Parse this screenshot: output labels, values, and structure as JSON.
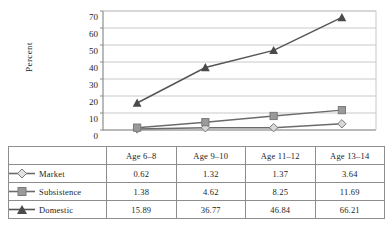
{
  "chart_data": {
    "type": "line",
    "title": "",
    "xlabel": "",
    "ylabel": "Percent",
    "ylim": [
      0,
      70
    ],
    "ytick_step": 10,
    "yticks": [
      70,
      60,
      50,
      40,
      30,
      20,
      10,
      0
    ],
    "grid": "horizontal",
    "legend_position": "table-left",
    "categories": [
      "Age 6–8",
      "Age 9–10",
      "Age 11–12",
      "Age 13–14"
    ],
    "series": [
      {
        "name": "Market",
        "marker": "diamond",
        "color": "#d8d8d8",
        "line_color": "#6b6b6b",
        "values": [
          0.62,
          1.32,
          1.37,
          3.64
        ]
      },
      {
        "name": "Subsistence",
        "marker": "square",
        "color": "#9a9a9a",
        "line_color": "#6b6b6b",
        "values": [
          1.38,
          4.62,
          8.25,
          11.69
        ]
      },
      {
        "name": "Domestic",
        "marker": "triangle",
        "color": "#4a4a4a",
        "line_color": "#555555",
        "values": [
          15.89,
          36.77,
          46.84,
          66.21
        ]
      }
    ]
  },
  "table": {
    "corner_label": "",
    "headers": [
      "Age 6–8",
      "Age 9–10",
      "Age 11–12",
      "Age 13–14"
    ],
    "rows": [
      {
        "label": "Market",
        "values": [
          "0.62",
          "1.32",
          "1.37",
          "3.64"
        ]
      },
      {
        "label": "Subsistence",
        "values": [
          "1.38",
          "4.62",
          "8.25",
          "11.69"
        ]
      },
      {
        "label": "Domestic",
        "values": [
          "15.89",
          "36.77",
          "46.84",
          "66.21"
        ]
      }
    ]
  },
  "axis": {
    "y_title": "Percent",
    "y_tick_labels": [
      "70",
      "60",
      "50",
      "40",
      "30",
      "20",
      "10",
      "0"
    ]
  },
  "colors": {
    "axis_line": "#8d8d8d",
    "grid_line": "#c9c9c9",
    "table_border": "#8d8d8d",
    "text": "#1c1c1c",
    "market_marker": "#d8d8d8",
    "subsistence_marker": "#9a9a9a",
    "domestic_marker": "#4a4a4a"
  }
}
